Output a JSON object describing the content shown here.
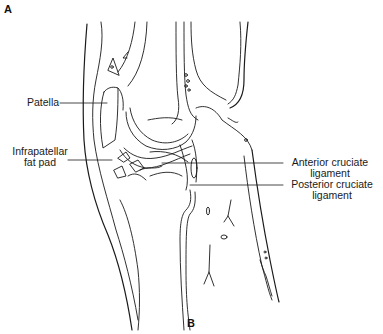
{
  "figure": {
    "panel_top": "A",
    "panel_bottom": "B",
    "line_color": "#1a1a1a",
    "background": "#ffffff"
  },
  "labels": {
    "patella": "Patella",
    "infrapatellar_line1": "Infrapatellar",
    "infrapatellar_line2": "fat pad",
    "acl_line1": "Anterior cruciate",
    "acl_line2": "ligament",
    "pcl_line1": "Posterior cruciate",
    "pcl_line2": "ligament"
  }
}
